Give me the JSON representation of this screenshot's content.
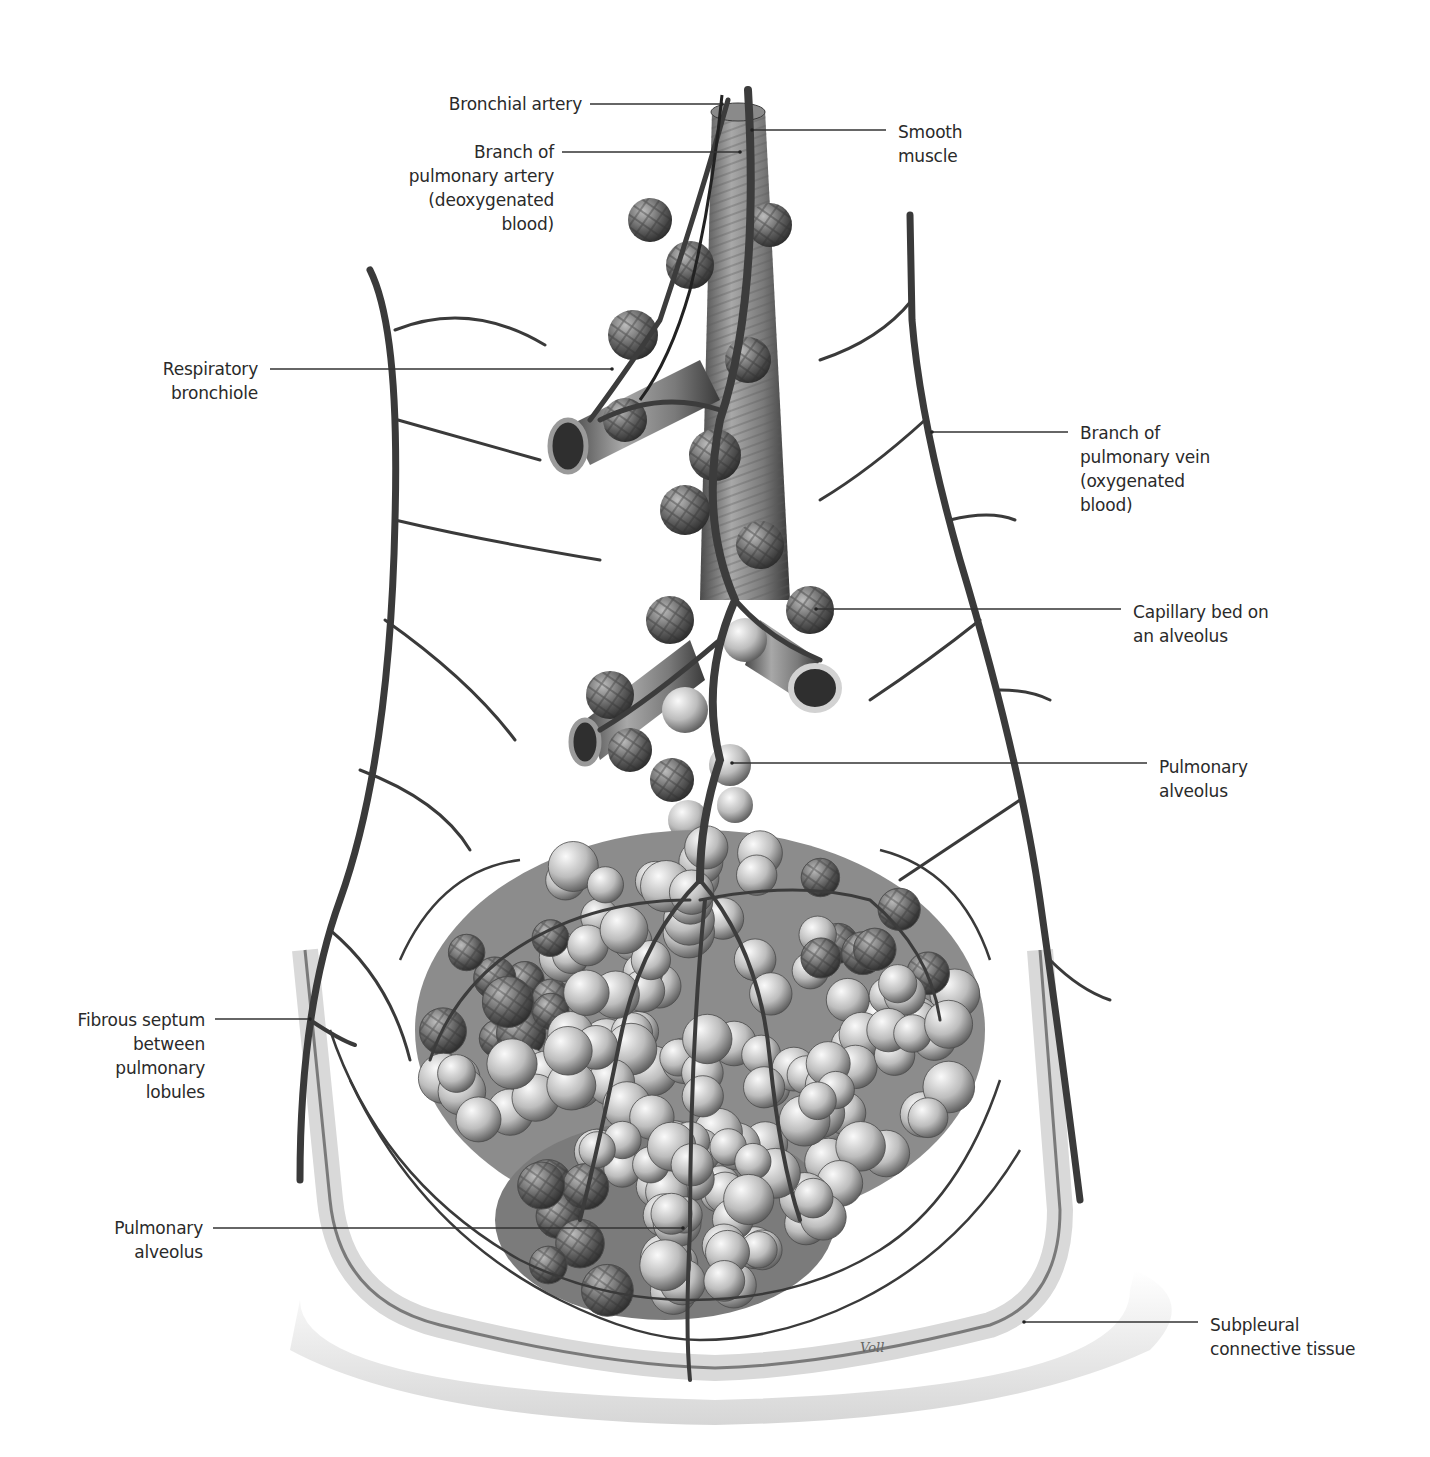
{
  "figure": {
    "signature": "Voll",
    "colors": {
      "background": "#ffffff",
      "label_text": "#2a2a2a",
      "leader_line": "#333333",
      "vessel_dark": "#3a3a3a",
      "vessel_mid": "#6a6a6a",
      "alveolus_light": "#d8d8d8",
      "alveolus_dark": "#555555",
      "septum": "#e4e4e4"
    }
  },
  "labels": [
    {
      "id": "bronchial-artery",
      "text": "Bronchial artery",
      "align": "right",
      "x": 436,
      "y": 92,
      "w": 146,
      "line": {
        "x1": 590,
        "y1": 104,
        "x2": 722,
        "y2": 104
      }
    },
    {
      "id": "pulmonary-artery-branch",
      "text": "Branch of\npulmonary artery\n(deoxygenated\nblood)",
      "align": "right",
      "x": 394,
      "y": 140,
      "w": 160,
      "line": {
        "x1": 562,
        "y1": 152,
        "x2": 740,
        "y2": 152
      }
    },
    {
      "id": "smooth-muscle",
      "text": "Smooth\nmuscle",
      "align": "left",
      "x": 898,
      "y": 120,
      "w": 100,
      "line": {
        "x1": 752,
        "y1": 130,
        "x2": 886,
        "y2": 130
      }
    },
    {
      "id": "respiratory-bronchiole",
      "text": "Respiratory\nbronchiole",
      "align": "right",
      "x": 140,
      "y": 357,
      "w": 118,
      "line": {
        "x1": 270,
        "y1": 369,
        "x2": 612,
        "y2": 369
      }
    },
    {
      "id": "pulmonary-vein-branch",
      "text": "Branch of\npulmonary vein\n(oxygenated\nblood)",
      "align": "left",
      "x": 1080,
      "y": 421,
      "w": 160,
      "line": {
        "x1": 932,
        "y1": 432,
        "x2": 1068,
        "y2": 432
      }
    },
    {
      "id": "capillary-bed",
      "text": "Capillary bed on\nan alveolus",
      "align": "left",
      "x": 1133,
      "y": 600,
      "w": 170,
      "line": {
        "x1": 816,
        "y1": 609,
        "x2": 1121,
        "y2": 609
      }
    },
    {
      "id": "pulmonary-alveolus-right",
      "text": "Pulmonary\nalveolus",
      "align": "left",
      "x": 1159,
      "y": 755,
      "w": 120,
      "line": {
        "x1": 732,
        "y1": 763,
        "x2": 1147,
        "y2": 763
      }
    },
    {
      "id": "fibrous-septum",
      "text": "Fibrous septum\nbetween\npulmonary\nlobules",
      "align": "right",
      "x": 60,
      "y": 1008,
      "w": 145,
      "line": {
        "x1": 215,
        "y1": 1019,
        "x2": 310,
        "y2": 1019
      }
    },
    {
      "id": "pulmonary-alveolus-left",
      "text": "Pulmonary\nalveolus",
      "align": "right",
      "x": 90,
      "y": 1216,
      "w": 113,
      "line": {
        "x1": 213,
        "y1": 1228,
        "x2": 683,
        "y2": 1228
      }
    },
    {
      "id": "subpleural-tissue",
      "text": "Subpleural\nconnective tissue",
      "align": "left",
      "x": 1210,
      "y": 1313,
      "w": 170,
      "line": {
        "x1": 1024,
        "y1": 1322,
        "x2": 1198,
        "y2": 1322
      }
    }
  ]
}
